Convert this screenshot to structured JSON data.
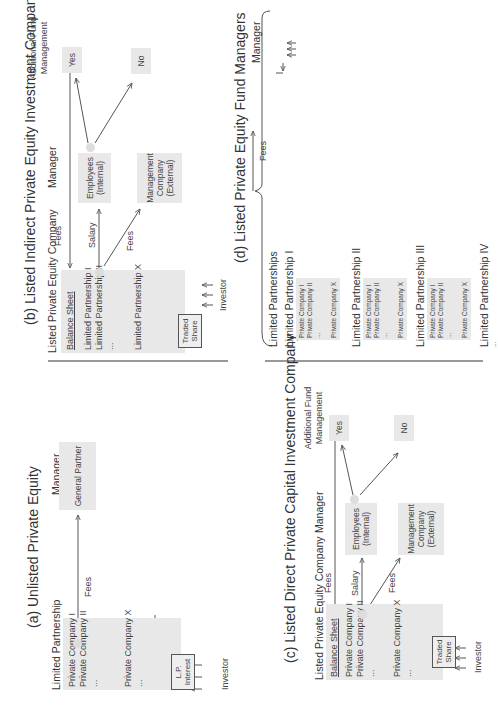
{
  "panels": {
    "a": {
      "title": "(a) Unlisted Private Equity",
      "left_header": "Limited Partnership",
      "right_header": "Manager",
      "holdings": [
        "Private Company I",
        "Private Company II",
        "...",
        "Private Company X",
        "..."
      ],
      "interest_label": "L.P. Interest",
      "investor_label": "Investor",
      "fees_label": "Fees",
      "manager_box": "General Partner"
    },
    "b": {
      "title": "(b) Listed Indirect Private Equity Investment Company (Funds-of-Funds)",
      "left_header": "Listed Private Equity Company",
      "mid_header": "Manager",
      "right_header": "Additional Fund Management",
      "balance_sheet": "Balance Sheet",
      "holdings": [
        "Limited Partnership I",
        "Limited Partnership II",
        "...",
        "Limited Partnership X"
      ],
      "share_label": "Traded Share",
      "investor_label": "Investor",
      "fees_top": "Fees",
      "salary_label": "Salary",
      "fees_low": "Fees",
      "employees_box": "Employees (Internal)",
      "mgmt_box": "Management Company (External)",
      "yes_box": "Yes",
      "no_box": "No"
    },
    "c": {
      "title": "(c) Listed Direct Private Capital Investment Company",
      "left_header": "Listed Private Equity Company",
      "mid_header": "Manager",
      "right_header": "Additional Fund Management",
      "balance_sheet": "Balance Sheet",
      "holdings": [
        "Private Company I",
        "Private Company II",
        "...",
        "Private Company X",
        "..."
      ],
      "share_label": "Traded Share",
      "investor_label": "Investor",
      "fees_top": "Fees",
      "salary_label": "Salary",
      "fees_low": "Fees",
      "employees_box": "Employees (Internal)",
      "mgmt_box": "Management Company (External)",
      "yes_box": "Yes",
      "no_box": "No"
    },
    "d": {
      "title": "(d) Listed Private Equity Fund Managers",
      "left_header": "Limited Partnerships",
      "right_header": "Manager",
      "partnerships": [
        {
          "name": "Limited Partnership I",
          "holdings": [
            "Private Company I",
            "Private Company II",
            "...",
            "Private Company X"
          ]
        },
        {
          "name": "Limited Partnership II",
          "holdings": [
            "Private Company I",
            "Private Company II",
            "...",
            "Private Company X"
          ]
        },
        {
          "name": "Limited Partnership III",
          "holdings": [
            "Private Company I",
            "Private Company II",
            "...",
            "Private Company X"
          ]
        },
        {
          "name": "Limited Partnership IV",
          "holdings": [
            "..."
          ]
        }
      ],
      "fees_label": "Fees",
      "gp_label": "General Partner",
      "mgmt_label": "Management Company",
      "share_label": "Traded Share",
      "investor_label": "Investor"
    }
  }
}
